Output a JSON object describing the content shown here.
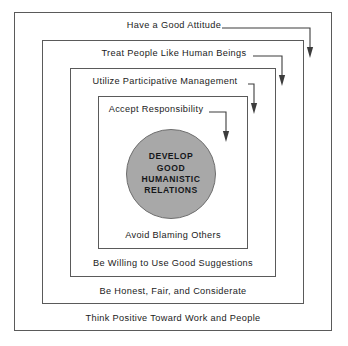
{
  "diagram": {
    "title_text": "Develop Good Humanistic Relations",
    "colors": {
      "border": "#5a5a5a",
      "circle_fill": "#a8a8a8",
      "circle_stroke": "#6e6e6e",
      "text": "#1b1b1b",
      "background": "#ffffff"
    },
    "center": {
      "label": "DEVELOP\nGOOD\nHUMANISTIC\nRELATIONS"
    },
    "layers": [
      {
        "index": 1,
        "top_label": "Have a Good Attitude",
        "bottom_label": "Think Positive Toward Work and People"
      },
      {
        "index": 2,
        "top_label": "Treat People Like Human Beings",
        "bottom_label": "Be Honest, Fair, and Considerate"
      },
      {
        "index": 3,
        "top_label": "Utilize Participative Management",
        "bottom_label": "Be Willing to Use Good Suggestions"
      },
      {
        "index": 4,
        "top_label": "Accept Responsibility",
        "bottom_label": "Avoid Blaming Others"
      }
    ],
    "arrows": [
      {
        "name": "arrow-have-a-good-attitude",
        "path": "M 222,28 L 310,28 L 310,47",
        "tip_y": 58
      },
      {
        "name": "arrow-treat-people-like-human-beings",
        "path": "M 253,56 L 282,56 L 282,75",
        "tip_y": 86
      },
      {
        "name": "arrow-utilize-participative-management",
        "path": "M 248,84 L 254,84 L 254,103",
        "tip_y": 114
      },
      {
        "name": "arrow-accept-responsibility",
        "path": "M 209,112 L 226,112 L 226,131",
        "tip_y": 142
      }
    ]
  }
}
